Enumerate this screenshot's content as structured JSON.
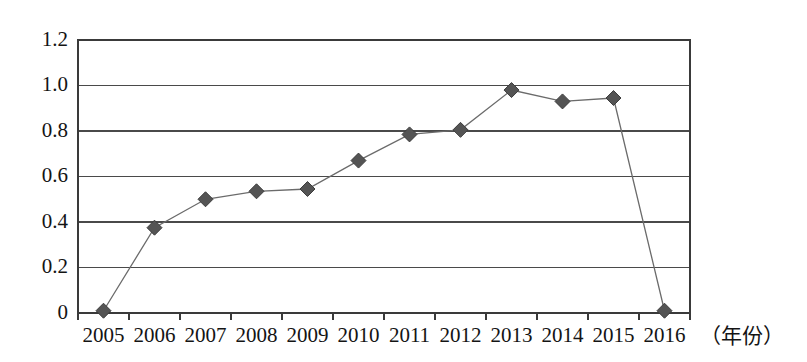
{
  "chart_data": {
    "type": "line",
    "title": "",
    "subtitle": "",
    "xlabel": "（年份）",
    "ylabel": "",
    "categories": [
      "2005",
      "2006",
      "2007",
      "2008",
      "2009",
      "2010",
      "2011",
      "2012",
      "2013",
      "2014",
      "2015",
      "2016"
    ],
    "values": [
      0.01,
      0.375,
      0.5,
      0.535,
      0.545,
      0.67,
      0.785,
      0.805,
      0.98,
      0.93,
      0.945,
      0.01
    ],
    "series": [
      {
        "name": "",
        "values": [
          0.01,
          0.375,
          0.5,
          0.535,
          0.545,
          0.67,
          0.785,
          0.805,
          0.98,
          0.93,
          0.945,
          0.01
        ]
      }
    ],
    "ylim": [
      0,
      1.2
    ],
    "ytick_labels": [
      "0",
      "0.2",
      "0.4",
      "0.6",
      "0.8",
      "1.0",
      "1.2"
    ],
    "ytick_values": [
      0,
      0.2,
      0.4,
      0.6,
      0.8,
      1.0,
      1.2
    ],
    "grid": true,
    "grid_axis": "y",
    "legend": false,
    "legend_position": "none",
    "marker": "diamond",
    "annotations": []
  },
  "style": {
    "line_color": "#6b6b6b",
    "marker_fill": "#545454",
    "marker_stroke": "#3d3d3d",
    "grid_color": "#4a4a4a",
    "border_color": "#3a3a3a",
    "text_color": "#141414",
    "background": "#ffffff"
  },
  "geometry": {
    "plot_left": 78,
    "plot_right": 690,
    "plot_top": 40,
    "plot_bottom": 313
  }
}
